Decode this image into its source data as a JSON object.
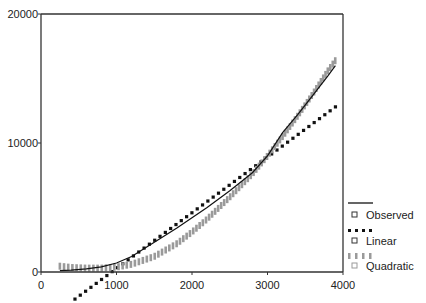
{
  "chart_data": {
    "type": "line",
    "title": "",
    "xlabel": "",
    "ylabel": "",
    "xlim": [
      0,
      4000
    ],
    "ylim": [
      0,
      20000
    ],
    "x_ticks": [
      0,
      1000,
      2000,
      3000,
      4000
    ],
    "x_tick_labels": [
      "0",
      "1000",
      "2000",
      "3000",
      "4000"
    ],
    "y_ticks": [
      0,
      10000,
      20000
    ],
    "y_tick_labels": [
      "0",
      "10000",
      "20000"
    ],
    "grid": false,
    "legend_position": "right",
    "series": [
      {
        "name": "Observed",
        "style": "solid",
        "color": "#111111",
        "x": [
          250,
          400,
          600,
          800,
          1000,
          1200,
          1500,
          1800,
          2000,
          2200,
          2500,
          2800,
          3000,
          3200,
          3400,
          3600,
          3800,
          3900
        ],
        "values": [
          100,
          150,
          250,
          400,
          700,
          1200,
          2300,
          3400,
          4200,
          5000,
          6300,
          7700,
          9000,
          10800,
          12200,
          13700,
          15200,
          16000
        ]
      },
      {
        "name": "Linear",
        "style": "dotted",
        "color": "#111111",
        "x": [
          450,
          3900
        ],
        "values": [
          -2100,
          12800
        ]
      },
      {
        "name": "Quadratic",
        "style": "hatched",
        "color": "#9a9a9a",
        "x": [
          250,
          400,
          600,
          800,
          1000,
          1200,
          1500,
          1800,
          2000,
          2200,
          2500,
          2800,
          3000,
          3200,
          3400,
          3600,
          3800,
          3900
        ],
        "values": [
          450,
          350,
          300,
          300,
          380,
          600,
          1200,
          2200,
          3100,
          4100,
          5800,
          7600,
          9000,
          10500,
          12100,
          13800,
          15600,
          16400
        ]
      }
    ]
  },
  "legend": {
    "items": [
      {
        "label": "Observed",
        "style": "solid"
      },
      {
        "label": "Linear",
        "style": "dotted"
      },
      {
        "label": "Quadratic",
        "style": "hatched"
      }
    ]
  }
}
